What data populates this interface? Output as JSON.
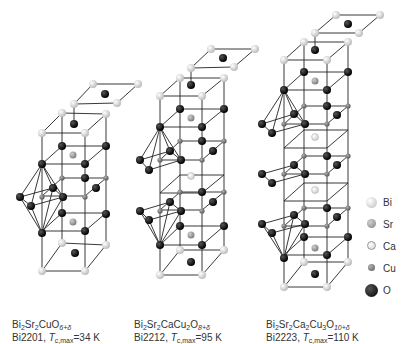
{
  "structures": [
    {
      "id": "bi2201",
      "formula": {
        "parts": [
          "Bi",
          "2",
          "Sr",
          "2",
          "CuO",
          "6+δ"
        ]
      },
      "name": "Bi2201",
      "tc_label": "T",
      "tc_sub": "c,max",
      "tc_value": "=34 K"
    },
    {
      "id": "bi2212",
      "formula": {
        "parts": [
          "Bi",
          "2",
          "Sr",
          "2",
          "CaCu",
          "2",
          "O",
          "8+δ"
        ]
      },
      "name": "Bi2212",
      "tc_label": "T",
      "tc_sub": "c,max",
      "tc_value": "=95 K"
    },
    {
      "id": "bi2223",
      "formula": {
        "parts": [
          "Bi",
          "2",
          "Sr",
          "2",
          "Ca",
          "2",
          "Cu",
          "3",
          "O",
          "10+δ"
        ]
      },
      "name": "Bi2223",
      "tc_label": "T",
      "tc_sub": "c,max",
      "tc_value": "=110 K"
    }
  ],
  "legend": [
    {
      "label": "Bi",
      "color": "#d8d8d8"
    },
    {
      "label": "Sr",
      "color": "#9a9a9a"
    },
    {
      "label": "Ca",
      "color": "#e6e6e6"
    },
    {
      "label": "Cu",
      "color": "#7a7a7a"
    },
    {
      "label": "O",
      "color": "#111111"
    }
  ],
  "captions": {
    "bi2201_l1_a": "Bi",
    "bi2201_l1_b": "2",
    "bi2201_l1_c": "Sr",
    "bi2201_l1_d": "2",
    "bi2201_l1_e": "CuO",
    "bi2201_l1_f": "6+δ",
    "bi2201_l2_a": "Bi2201, ",
    "bi2201_l2_b": "T",
    "bi2201_l2_c": "c,max",
    "bi2201_l2_d": "=34 K",
    "bi2212_l1_a": "Bi",
    "bi2212_l1_b": "2",
    "bi2212_l1_c": "Sr",
    "bi2212_l1_d": "2",
    "bi2212_l1_e": "CaCu",
    "bi2212_l1_f": "2",
    "bi2212_l1_g": "O",
    "bi2212_l1_h": "8+δ",
    "bi2212_l2_a": "Bi2212, ",
    "bi2212_l2_b": "T",
    "bi2212_l2_c": "c,max",
    "bi2212_l2_d": "=95 K",
    "bi2223_l1_a": "Bi",
    "bi2223_l1_b": "2",
    "bi2223_l1_c": "Sr",
    "bi2223_l1_d": "2",
    "bi2223_l1_e": "Ca",
    "bi2223_l1_f": "2",
    "bi2223_l1_g": "Cu",
    "bi2223_l1_h": "3",
    "bi2223_l1_i": "O",
    "bi2223_l1_j": "10+δ",
    "bi2223_l2_a": "Bi2223, ",
    "bi2223_l2_b": "T",
    "bi2223_l2_c": "c,max",
    "bi2223_l2_d": "=110 K"
  }
}
